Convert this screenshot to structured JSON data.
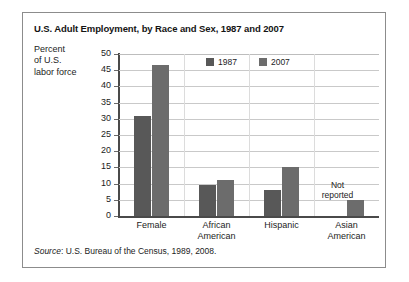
{
  "figure": {
    "title": "U.S. Adult Employment, by Race and Sex, 1987 and 2007",
    "axis_caption": {
      "line1": "Percent",
      "line2": "of U.S.",
      "line3": "labor force"
    },
    "source_word": "Source",
    "source_rest": ": U.S. Bureau of the Census, 1989, 2008.",
    "not_reported_note": {
      "line1": "Not",
      "line2": "reported"
    }
  },
  "colors": {
    "series_1987": "#585858",
    "series_2007": "#6c6c6c",
    "axis": "#4a4a4a",
    "gridline": "#c9c9c9",
    "border": "#8c8c8c",
    "text": "#1c1c1c"
  },
  "chart_data": {
    "type": "bar",
    "title": "U.S. Adult Employment, by Race and Sex, 1987 and 2007",
    "xlabel": "",
    "ylabel": "Percent of U.S. labor force",
    "ylim": [
      0,
      50
    ],
    "yticks": [
      50,
      45,
      40,
      35,
      30,
      25,
      20,
      15,
      10,
      5,
      0
    ],
    "grid": true,
    "legend_position": "top-center",
    "categories": [
      "Female",
      "African American",
      "Hispanic",
      "Asian American"
    ],
    "category_lines": [
      [
        "Female"
      ],
      [
        "African",
        "American"
      ],
      [
        "Hispanic"
      ],
      [
        "Asian",
        "American"
      ]
    ],
    "series": [
      {
        "name": "1987",
        "color": "#585858",
        "values": [
          31,
          9.5,
          8,
          null
        ],
        "value_notes": [
          null,
          null,
          null,
          "Not reported"
        ]
      },
      {
        "name": "2007",
        "color": "#6c6c6c",
        "values": [
          46.5,
          11,
          15,
          5
        ],
        "value_notes": [
          null,
          null,
          null,
          null
        ]
      }
    ],
    "annotations": [
      {
        "text": "Not reported",
        "category": "Asian American",
        "series": "1987"
      }
    ],
    "source": "Source: U.S. Bureau of the Census, 1989, 2008."
  }
}
